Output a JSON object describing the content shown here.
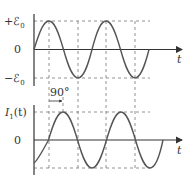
{
  "top_graph": {
    "y_labels": {
      "plus": "+ℰ",
      "plus_sub": "0",
      "zero": "0",
      "minus": "−ℰ",
      "minus_sub": "0"
    },
    "x_label": "t",
    "phase_label": "90°"
  },
  "bottom_graph": {
    "y_label": "I",
    "y_label_sub": "1",
    "y_label_suffix": "(t)",
    "zero": "0",
    "x_label": "t"
  },
  "colors": {
    "curve": "#555555",
    "axis": "#333333",
    "guide": "#777777"
  }
}
